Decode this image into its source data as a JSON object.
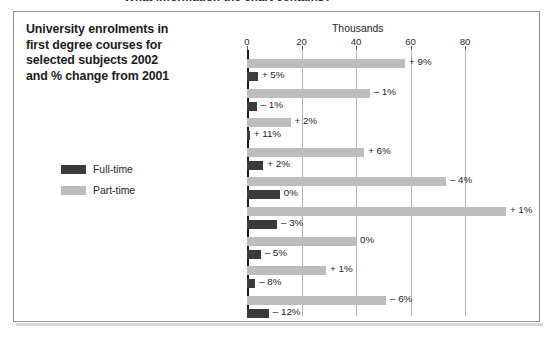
{
  "caption": "What information the chart contains?",
  "title": {
    "lines": [
      "University enrolments in",
      "first degree courses for",
      "selected subjects 2002",
      "and % change from 2001"
    ]
  },
  "legend": {
    "items": [
      {
        "label": "Full-time",
        "color": "#3a3a3a",
        "key": "full"
      },
      {
        "label": "Part-time",
        "color": "#bdbdbd",
        "key": "part"
      }
    ]
  },
  "chart_data": {
    "type": "bar",
    "orientation": "horizontal",
    "title": "University enrolments in first degree courses for selected subjects 2002 and % change from 2001",
    "xlabel": "Thousands",
    "ylabel": "",
    "xlim": [
      0,
      100
    ],
    "ticks": [
      0,
      20,
      40,
      60,
      80
    ],
    "tick_labels": [
      "0",
      "20",
      "40",
      "60",
      "80"
    ],
    "grid": true,
    "legend_position": "left",
    "categories": [
      "Biological sciences",
      "Physical sciences",
      "Mathematical sciences",
      "Computer sciences",
      "Engineering & tech",
      "Business & Admin studies",
      "Language",
      "Humanities",
      "Education"
    ],
    "category_lines": [
      [
        "Biological",
        "sciences"
      ],
      [
        "Physical",
        "sciences"
      ],
      [
        "Mathematical",
        "sciences"
      ],
      [
        "Computer",
        "sciences"
      ],
      [
        "Engineering",
        "& tech"
      ],
      [
        "Business &",
        "Admin studies"
      ],
      [
        "Language"
      ],
      [
        "Humanities"
      ],
      [
        "Education"
      ]
    ],
    "series": [
      {
        "name": "Part-time",
        "color": "#bdbdbd",
        "values": [
          58,
          45,
          16,
          43,
          73,
          95,
          40,
          29,
          51
        ],
        "change_labels": [
          "+ 9%",
          "– 1%",
          "+ 2%",
          "+ 6%",
          "– 4%",
          "+ 1%",
          "0%",
          "+ 1%",
          "– 6%"
        ]
      },
      {
        "name": "Full-time",
        "color": "#3a3a3a",
        "values": [
          4,
          3.5,
          1,
          6,
          12,
          11,
          5,
          3,
          8
        ],
        "change_labels": [
          "+ 5%",
          "– 1%",
          "+ 11%",
          "+ 2%",
          "0%",
          "– 3%",
          "– 5%",
          "– 8%",
          "– 12%"
        ]
      }
    ]
  }
}
